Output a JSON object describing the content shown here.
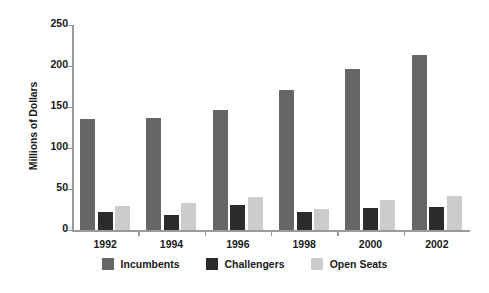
{
  "chart_data": {
    "type": "bar",
    "title": "",
    "subtitle": "",
    "xlabel": "",
    "ylabel": "Millions of Dollars",
    "categories": [
      "1992",
      "1994",
      "1996",
      "1998",
      "2000",
      "2002"
    ],
    "series": [
      {
        "name": "Incumbents",
        "color": "#666666",
        "values": [
          135,
          137,
          146,
          171,
          196,
          214
        ]
      },
      {
        "name": "Challengers",
        "color": "#2b2b2b",
        "values": [
          22,
          18,
          30,
          22,
          27,
          28
        ]
      },
      {
        "name": "Open Seats",
        "color": "#cccccc",
        "values": [
          29,
          33,
          40,
          26,
          36,
          41
        ]
      }
    ],
    "ylim": [
      0,
      250
    ],
    "yticks": [
      0,
      50,
      100,
      150,
      200,
      250
    ],
    "ytick_labels": [
      "0",
      "50",
      "100",
      "150",
      "200",
      "250"
    ],
    "grid": false,
    "legend_position": "bottom",
    "legend_entries": [
      "Incumbents",
      "Challengers",
      "Open Seats"
    ],
    "annotations": []
  },
  "colors": {
    "axis": "#9a9a9a",
    "text": "#1a1a1a",
    "background": "#ffffff",
    "incumbents": "#666666",
    "challengers": "#2b2b2b",
    "open_seats": "#cccccc"
  }
}
